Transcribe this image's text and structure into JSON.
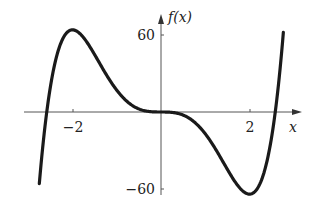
{
  "chart_data": {
    "type": "line",
    "title": "",
    "xlabel": "x",
    "ylabel": "f(x)",
    "function": "f(x) = 3x^5 - 20x^3",
    "x_ticks": [
      -2,
      2
    ],
    "x_tick_labels": [
      "−2",
      "2"
    ],
    "y_ticks": [
      60,
      -60
    ],
    "y_tick_labels": [
      "60",
      "−60"
    ],
    "xlim": [
      -3.2,
      3.3
    ],
    "ylim": [
      -70,
      75
    ],
    "grid": false,
    "legend": null,
    "series": [
      {
        "name": "f(x)",
        "x": [
          -2.75,
          -2.58,
          -2.5,
          -2.25,
          -2.0,
          -1.75,
          -1.5,
          -1.25,
          -1.0,
          -0.75,
          -0.5,
          -0.25,
          0,
          0.25,
          0.5,
          0.75,
          1.0,
          1.25,
          1.5,
          1.75,
          2.0,
          2.25,
          2.5,
          2.58,
          2.75
        ],
        "values": [
          -65,
          0,
          16.4,
          51.7,
          64,
          57.6,
          44.7,
          30.5,
          17,
          7.5,
          2.2,
          0.3,
          0,
          -0.3,
          -2.2,
          -7.5,
          -17,
          -30.5,
          -44.7,
          -57.6,
          -64,
          -51.7,
          -16.4,
          0,
          65
        ]
      }
    ],
    "key_points": {
      "local_max": {
        "x": -2,
        "y": 64
      },
      "local_min": {
        "x": 2,
        "y": -64
      },
      "inflection": {
        "x": 0,
        "y": 0
      },
      "roots": [
        -2.58,
        0,
        2.58
      ]
    }
  },
  "labels": {
    "y_axis_label": "f(x)",
    "x_axis_label": "x",
    "tick_60": "60",
    "tick_neg60": "−60",
    "tick_neg2": "−2",
    "tick_2": "2"
  }
}
